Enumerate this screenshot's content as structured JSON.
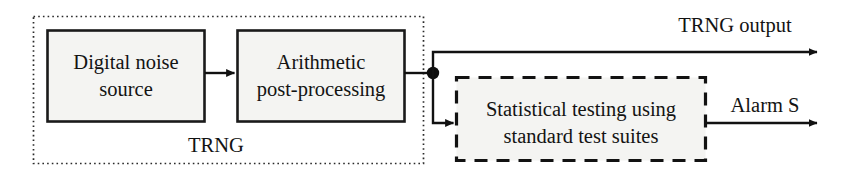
{
  "diagram": {
    "colors": {
      "stroke": "#111111",
      "box_fill": "#f4f4f2",
      "background": "#ffffff",
      "dot": "#0d0d0d"
    },
    "blocks": [
      {
        "id": "digital-noise-source",
        "name": "Digital noise source",
        "line1": "Digital noise",
        "line2": "source",
        "border": "solid"
      },
      {
        "id": "arithmetic-post-processing",
        "name": "Arithmetic post-processing",
        "line1": "Arithmetic",
        "line2": "post-processing",
        "border": "solid"
      },
      {
        "id": "statistical-testing",
        "name": "Statistical testing using standard test suites",
        "line1": "Statistical testing using",
        "line2": "standard test suites",
        "border": "dashed"
      }
    ],
    "groups": [
      {
        "id": "trng-group",
        "label": "TRNG",
        "border": "dotted"
      }
    ],
    "signals": [
      {
        "id": "noise-to-postproc",
        "label": "",
        "arrow": true
      },
      {
        "id": "trng-output",
        "label": "TRNG output",
        "arrow": true
      },
      {
        "id": "alarm-s",
        "label": "Alarm S",
        "arrow": true
      },
      {
        "id": "tap-to-testing",
        "label": "",
        "arrow": true
      }
    ]
  }
}
